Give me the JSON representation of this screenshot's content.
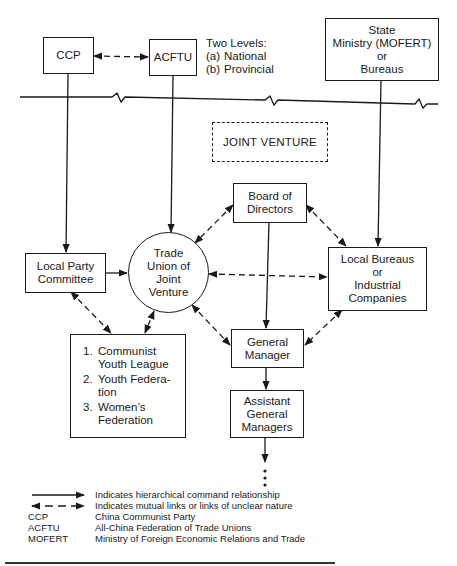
{
  "diagram": {
    "nodes": {
      "ccp": {
        "label": "CCP"
      },
      "acftu": {
        "label": "ACFTU"
      },
      "state_ministry": {
        "lines": [
          "State",
          "Ministry (MOFERT)",
          "or",
          "Bureaus"
        ]
      },
      "joint_venture": {
        "label": "JOINT VENTURE"
      },
      "board": {
        "lines": [
          "Board of",
          "Directors"
        ]
      },
      "local_party": {
        "lines": [
          "Local Party",
          "Committee"
        ]
      },
      "trade_union": {
        "lines": [
          "Trade",
          "Union of",
          "Joint",
          "Venture"
        ]
      },
      "local_bureaus": {
        "lines": [
          "Local Bureaus",
          "or",
          "Industrial",
          "Companies"
        ]
      },
      "general_manager": {
        "lines": [
          "General",
          "Manager"
        ]
      },
      "assistant_gm": {
        "lines": [
          "Assistant",
          "General",
          "Managers"
        ]
      },
      "organizations": {
        "items": [
          {
            "num": "1.",
            "lines": [
              "Communist",
              "Youth League"
            ]
          },
          {
            "num": "2.",
            "lines": [
              "Youth Federa-",
              "tion"
            ]
          },
          {
            "num": "3.",
            "lines": [
              "Women’s",
              "Federation"
            ]
          }
        ]
      }
    },
    "acftu_levels": {
      "title": "Two Levels:",
      "items": [
        {
          "key": "(a)",
          "value": "National"
        },
        {
          "key": "(b)",
          "value": "Provincial"
        }
      ]
    },
    "edges": [
      {
        "from": "CCP",
        "to": "ACFTU",
        "type": "mutual"
      },
      {
        "from": "CCP",
        "to": "Local Party Committee",
        "type": "hierarchical"
      },
      {
        "from": "ACFTU",
        "to": "Trade Union of Joint Venture",
        "type": "hierarchical"
      },
      {
        "from": "State Ministry (MOFERT) or Bureaus",
        "to": "Local Bureaus or Industrial Companies",
        "type": "hierarchical"
      },
      {
        "from": "Local Party Committee",
        "to": "Trade Union of Joint Venture",
        "type": "hierarchical"
      },
      {
        "from": "Board of Directors",
        "to": "Trade Union of Joint Venture",
        "type": "mutual"
      },
      {
        "from": "Board of Directors",
        "to": "Local Bureaus or Industrial Companies",
        "type": "mutual"
      },
      {
        "from": "Board of Directors",
        "to": "General Manager",
        "type": "hierarchical"
      },
      {
        "from": "Trade Union of Joint Venture",
        "to": "Local Bureaus or Industrial Companies",
        "type": "mutual"
      },
      {
        "from": "Trade Union of Joint Venture",
        "to": "General Manager",
        "type": "mutual"
      },
      {
        "from": "Local Bureaus or Industrial Companies",
        "to": "General Manager",
        "type": "mutual"
      },
      {
        "from": "Local Party Committee",
        "to": "Mass Organizations",
        "type": "mutual"
      },
      {
        "from": "Trade Union of Joint Venture",
        "to": "Mass Organizations",
        "type": "mutual"
      },
      {
        "from": "General Manager",
        "to": "Assistant General Managers",
        "type": "hierarchical"
      },
      {
        "from": "Assistant General Managers",
        "to": "...",
        "type": "hierarchical"
      }
    ]
  },
  "legend": {
    "arrows": [
      {
        "type": "solid",
        "text": "Indicates hierarchical command relationship"
      },
      {
        "type": "dashed",
        "text": "Indicates mutual links or links of unclear nature"
      }
    ],
    "abbreviations": [
      {
        "abbr": "CCP",
        "text": "China Communist Party"
      },
      {
        "abbr": "ACFTU",
        "text": "All-China Federation of Trade Unions"
      },
      {
        "abbr": "MOFERT",
        "text": "Ministry of Foreign Economic Relations and Trade"
      }
    ]
  }
}
